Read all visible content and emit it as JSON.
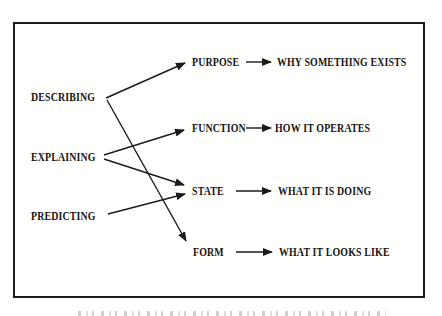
{
  "figure": {
    "ink_color": "#1b1b1b",
    "background_color": "#fffffe",
    "left_column": [
      {
        "label": "DESCRIBING"
      },
      {
        "label": "EXPLAINING"
      },
      {
        "label": "PREDICTING"
      }
    ],
    "middle_column": [
      {
        "label": "PURPOSE",
        "description": "WHY SOMETHING EXISTS"
      },
      {
        "label": "FUNCTION",
        "description": "HOW IT OPERATES"
      },
      {
        "label": "STATE",
        "description": "WHAT IT IS DOING"
      },
      {
        "label": "FORM",
        "description": "WHAT IT LOOKS LIKE"
      }
    ],
    "connections": [
      {
        "from": "DESCRIBING",
        "to": "PURPOSE"
      },
      {
        "from": "DESCRIBING",
        "to": "FORM"
      },
      {
        "from": "EXPLAINING",
        "to": "FUNCTION"
      },
      {
        "from": "EXPLAINING",
        "to": "STATE"
      },
      {
        "from": "PREDICTING",
        "to": "STATE"
      }
    ]
  }
}
